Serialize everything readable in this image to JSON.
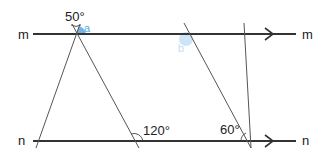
{
  "diagram": {
    "lines": {
      "m": {
        "label_left": "m",
        "label_right": "m"
      },
      "n": {
        "label_left": "n",
        "label_right": "n"
      }
    },
    "angles": {
      "top_left": "50°",
      "bottom_middle": "120°",
      "bottom_right": "60°"
    },
    "unknowns": {
      "a": "a",
      "b": "b"
    },
    "colors": {
      "line": "#333333",
      "highlight": "#5aa9e0",
      "highlight_faint": "#bfe0f5"
    }
  }
}
